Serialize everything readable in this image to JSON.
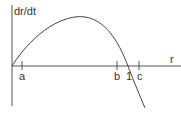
{
  "diagram": {
    "y_axis_label": "dr/dt",
    "x_axis_label": "r",
    "ticks": [
      {
        "label": "a",
        "x": 22
      },
      {
        "label": "b",
        "x": 117
      },
      {
        "label": "1",
        "x": 128
      },
      {
        "label": "c",
        "x": 140
      }
    ],
    "colors": {
      "axis": "#555555",
      "curve": "#444444",
      "text": "#333333"
    }
  }
}
